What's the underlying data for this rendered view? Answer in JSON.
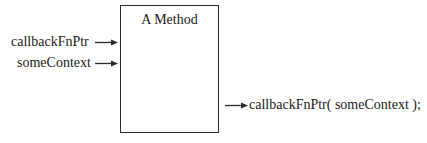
{
  "diagram": {
    "method_box": {
      "title": "A Method"
    },
    "inputs": [
      {
        "label": "callbackFnPtr"
      },
      {
        "label": "someContext"
      }
    ],
    "output": {
      "label": "callbackFnPtr( someContext );"
    },
    "colors": {
      "stroke": "#2a2a2a",
      "text": "#1a1a1a",
      "background": "#ffffff"
    }
  }
}
